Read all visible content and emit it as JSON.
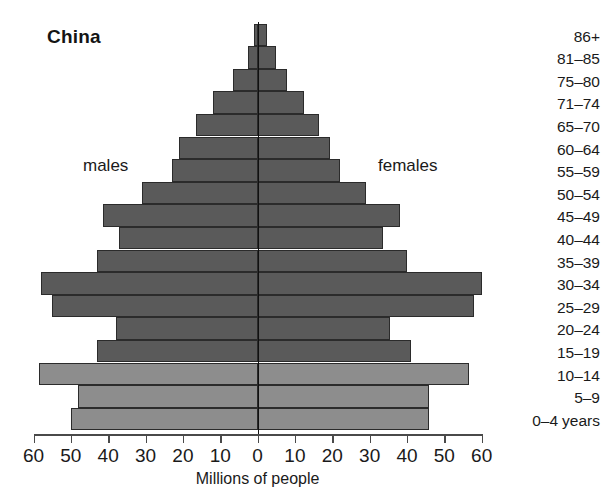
{
  "chart_data": {
    "type": "bar",
    "subtype": "population-pyramid",
    "title": "China",
    "xlabel": "Millions of people",
    "ylabel": "",
    "grid": false,
    "legend_position": "inline",
    "axis_unit_note": "0–4 years",
    "xlim": [
      -60,
      60
    ],
    "xticks": [
      60,
      50,
      40,
      30,
      20,
      10,
      0,
      10,
      20,
      30,
      40,
      50,
      60
    ],
    "xtick_labels": [
      "60",
      "50",
      "40",
      "30",
      "20",
      "10",
      "0",
      "10",
      "20",
      "30",
      "40",
      "50",
      "60"
    ],
    "categories": [
      "86+",
      "81–85",
      "75–80",
      "71–74",
      "65–70",
      "60–64",
      "55–59",
      "50–54",
      "45–49",
      "40–44",
      "35–39",
      "30–34",
      "25–29",
      "20–24",
      "15–19",
      "10–14",
      "5–9",
      "0–4"
    ],
    "series": [
      {
        "name": "males",
        "side": "left",
        "color": "#5a5a5a",
        "values": [
          1.0,
          2.5,
          6.5,
          12.0,
          16.5,
          21.0,
          23.0,
          31.0,
          41.5,
          37.0,
          43.0,
          58.0,
          55.0,
          38.0,
          43.0,
          58.5,
          48.0,
          50.0
        ]
      },
      {
        "name": "females",
        "side": "right",
        "color": "#5a5a5a",
        "values": [
          2.5,
          5.0,
          8.0,
          12.5,
          16.5,
          19.5,
          22.0,
          29.0,
          38.0,
          33.5,
          40.0,
          60.0,
          58.0,
          35.5,
          41.0,
          56.5,
          46.0,
          46.0
        ]
      }
    ],
    "highlighted_rows": [
      "10–14",
      "5–9",
      "0–4"
    ],
    "highlight_color": "#8d8d8d"
  },
  "labels": {
    "males": "males",
    "females": "females",
    "axis_title": "Millions of people",
    "age_unit": "years"
  }
}
